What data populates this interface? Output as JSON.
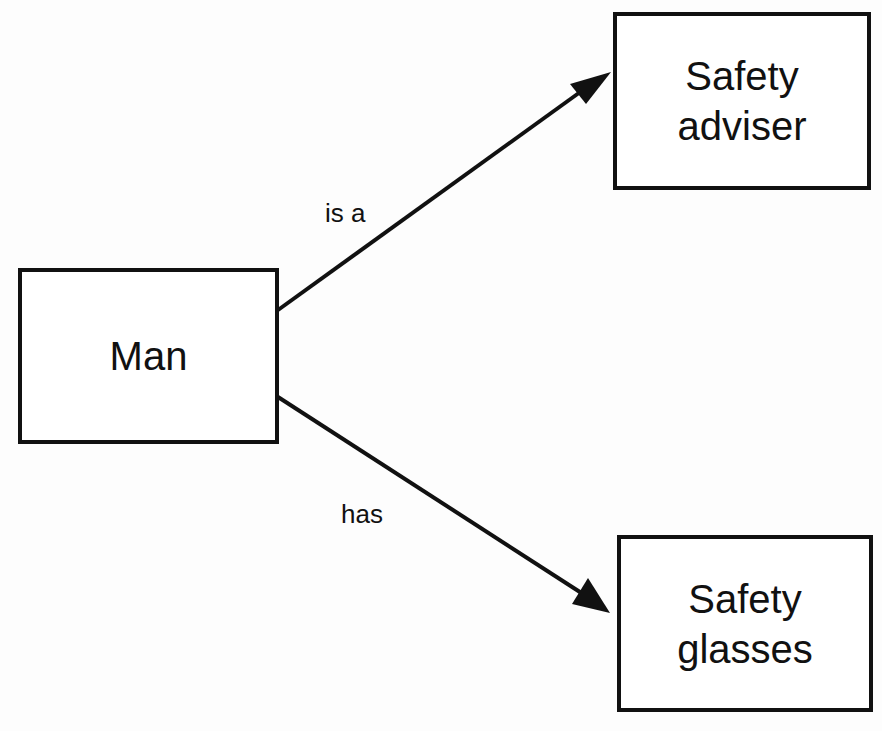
{
  "nodes": {
    "man": {
      "label": "Man"
    },
    "adviser": {
      "label_line1": "Safety",
      "label_line2": "adviser"
    },
    "glasses": {
      "label_line1": "Safety",
      "label_line2": "glasses"
    }
  },
  "edges": {
    "is_a": {
      "label": "is a",
      "from": "Man",
      "to": "Safety adviser"
    },
    "has": {
      "label": "has",
      "from": "Man",
      "to": "Safety glasses"
    }
  },
  "colors": {
    "stroke": "#111111",
    "background": "#fdfdfd"
  }
}
